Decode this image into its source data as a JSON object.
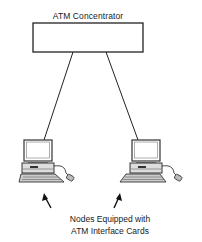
{
  "diagram": {
    "concentrator_label": "ATM Concentrator",
    "nodes": [
      {
        "id": "node-left",
        "icon": "desktop-computer-icon"
      },
      {
        "id": "node-right",
        "icon": "desktop-computer-icon"
      }
    ],
    "caption_line1": "Nodes Equipped with",
    "caption_line2": "ATM Interface Cards",
    "colors": {
      "stroke": "#222222",
      "background": "#ffffff"
    }
  }
}
